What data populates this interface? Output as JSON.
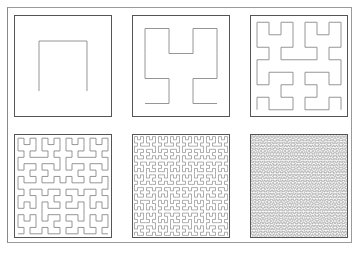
{
  "figure": {
    "panels": [
      {
        "order": 1,
        "x": 14,
        "y": 15,
        "w": 98,
        "h": 102
      },
      {
        "order": 2,
        "x": 132,
        "y": 15,
        "w": 98,
        "h": 102
      },
      {
        "order": 3,
        "x": 250,
        "y": 15,
        "w": 98,
        "h": 102
      },
      {
        "order": 4,
        "x": 14,
        "y": 134,
        "w": 98,
        "h": 104
      },
      {
        "order": 5,
        "x": 132,
        "y": 134,
        "w": 98,
        "h": 104
      },
      {
        "order": 6,
        "x": 250,
        "y": 134,
        "w": 98,
        "h": 104
      }
    ],
    "colors": {
      "curve": "#8a8a8a",
      "border": "#555555",
      "frame": "#9a9a9a"
    }
  }
}
